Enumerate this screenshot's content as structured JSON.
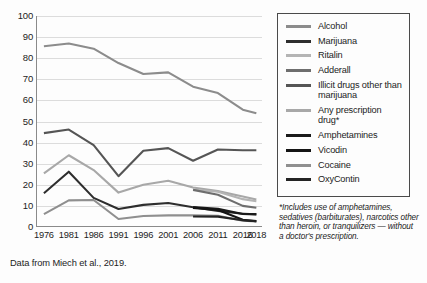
{
  "caption": "Data from Miech et al., 2019.",
  "footnote": "*Includes use of amphetamines, sedatives (barbiturates), narcotics other than heroin, or tranquilizers — without a doctor's prescription.",
  "axes": {
    "y_ticks": [
      "100",
      "90",
      "80",
      "70",
      "60",
      "50",
      "40",
      "30",
      "20",
      "10",
      "0"
    ],
    "x_ticks": [
      "1976",
      "1981",
      "1986",
      "1991",
      "1996",
      "2001",
      "2006",
      "2011",
      "2016",
      "2018"
    ]
  },
  "legend": {
    "items": [
      {
        "label": "Alcohol",
        "color": "#8c8c8c"
      },
      {
        "label": "Marijuana",
        "color": "#2e2e2e"
      },
      {
        "label": "Ritalin",
        "color": "#b4b4b4"
      },
      {
        "label": "Adderall",
        "color": "#6e6e6e"
      },
      {
        "label": "Illicit drugs other than marijuana",
        "color": "#555555"
      },
      {
        "label": "Any prescription drug*",
        "color": "#a8a8a8"
      },
      {
        "label": "Amphetamines",
        "color": "#1a1a1a"
      },
      {
        "label": "Vicodin",
        "color": "#141414"
      },
      {
        "label": "Cocaine",
        "color": "#8f8f8f"
      },
      {
        "label": "OxyContin",
        "color": "#242424"
      }
    ]
  },
  "chart_data": {
    "type": "line",
    "title": "",
    "xlabel": "",
    "ylabel": "",
    "ylim": [
      0,
      100
    ],
    "y_gridlines": [
      0,
      10,
      20,
      30,
      40,
      50,
      60,
      70,
      80,
      90,
      100
    ],
    "grid": true,
    "legend_position": "right-outside",
    "x": [
      1976,
      1981,
      1986,
      1991,
      1996,
      2001,
      2006,
      2011,
      2016,
      2018
    ],
    "series": [
      {
        "name": "Alcohol",
        "color": "#8c8c8c",
        "x": [
          1976,
          1981,
          1986,
          1991,
          1996,
          2001,
          2006,
          2011,
          2016,
          2018
        ],
        "values": [
          85.7,
          87.0,
          84.5,
          77.7,
          72.5,
          73.3,
          66.5,
          63.5,
          55.6,
          53.9
        ]
      },
      {
        "name": "Illicit drugs other than marijuana",
        "color": "#555555",
        "x": [
          1976,
          1981,
          1986,
          1991,
          1996,
          2001,
          2006,
          2011,
          2016,
          2018
        ],
        "values": [
          44.5,
          46.2,
          38.8,
          24.1,
          36.1,
          37.4,
          31.4,
          36.7,
          36.4,
          36.4
        ]
      },
      {
        "name": "Any prescription drug*",
        "color": "#a8a8a8",
        "x": [
          1976,
          1981,
          1986,
          1991,
          1996,
          2001,
          2006,
          2011,
          2016,
          2018
        ],
        "values": [
          25.4,
          34.0,
          27.0,
          16.3,
          20.0,
          21.9,
          18.7,
          17.0,
          14.5,
          13.0
        ]
      },
      {
        "name": "Marijuana",
        "color": "#2e2e2e",
        "x": [
          1976,
          1981,
          1986,
          1991,
          1996,
          2001,
          2006,
          2011,
          2016,
          2018
        ],
        "values": [
          16.0,
          26.2,
          13.8,
          8.5,
          10.5,
          11.4,
          9.4,
          7.6,
          6.3,
          6.1
        ]
      },
      {
        "name": "Cocaine",
        "color": "#8f8f8f",
        "x": [
          1976,
          1981,
          1986,
          1991,
          1996,
          2001,
          2006,
          2011,
          2016,
          2018
        ],
        "values": [
          6.1,
          12.6,
          12.8,
          3.8,
          5.2,
          5.5,
          5.6,
          5.3,
          3.0,
          2.6
        ]
      },
      {
        "name": "Ritalin",
        "color": "#b4b4b4",
        "x": [
          2006,
          2011,
          2016,
          2018
        ],
        "values": [
          17.8,
          16.7,
          13.2,
          12.2
        ]
      },
      {
        "name": "Adderall",
        "color": "#6e6e6e",
        "x": [
          2006,
          2011,
          2016,
          2018
        ],
        "values": [
          17.6,
          15.3,
          10.0,
          9.1
        ]
      },
      {
        "name": "Amphetamines",
        "color": "#1a1a1a",
        "x": [
          2006,
          2011,
          2016,
          2018
        ],
        "values": [
          9.4,
          8.6,
          6.2,
          6.0
        ]
      },
      {
        "name": "Vicodin",
        "color": "#141414",
        "x": [
          2006,
          2011,
          2016,
          2018
        ],
        "values": [
          9.0,
          8.1,
          3.4,
          2.8
        ]
      },
      {
        "name": "OxyContin",
        "color": "#242424",
        "x": [
          2006,
          2011,
          2016,
          2018
        ],
        "values": [
          5.0,
          4.9,
          3.2,
          2.7
        ]
      }
    ]
  }
}
